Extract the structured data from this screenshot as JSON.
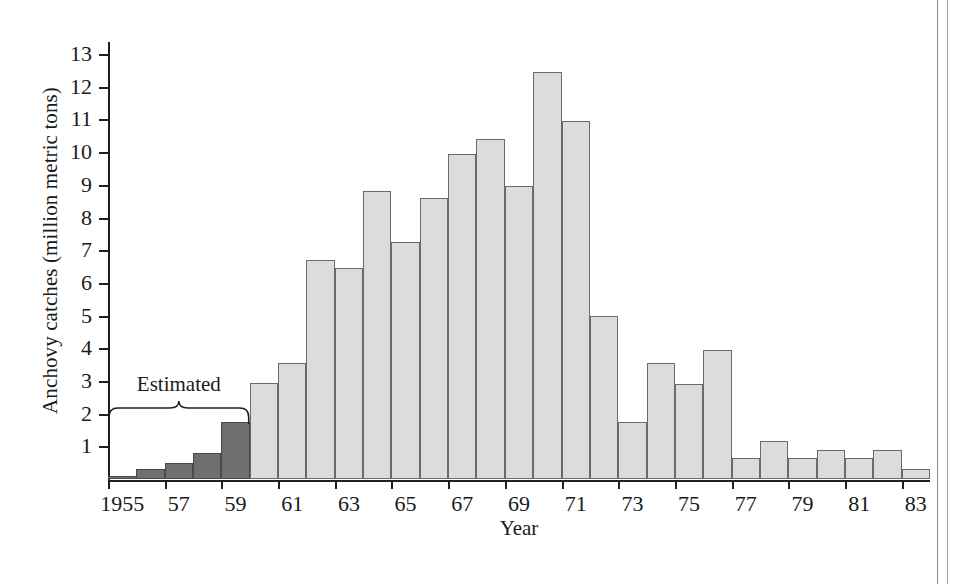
{
  "figure": {
    "y_axis_title": "Anchovy catches (million metric tons)",
    "x_axis_title": "Year",
    "annotation_label": "Estimated",
    "colors": {
      "estimated_bar": "#6f6f6f",
      "reported_bar": "#dcdcdc",
      "axis": "#1f1f1f",
      "bar_outline": "#6a6a6a"
    }
  },
  "chart_data": {
    "type": "bar",
    "title": "",
    "xlabel": "Year",
    "ylabel": "Anchovy catches (million metric tons)",
    "ylim": [
      0,
      13.4
    ],
    "xlim": [
      1954.5,
      1983.5
    ],
    "grid": false,
    "legend": null,
    "ytick_labels": [
      "1",
      "2",
      "3",
      "4",
      "5",
      "6",
      "7",
      "8",
      "9",
      "10",
      "11",
      "12",
      "13"
    ],
    "ytick_values": [
      1,
      2,
      3,
      4,
      5,
      6,
      7,
      8,
      9,
      10,
      11,
      12,
      13
    ],
    "xtick_labels": [
      "1955",
      "57",
      "59",
      "61",
      "63",
      "65",
      "67",
      "69",
      "71",
      "73",
      "75",
      "77",
      "79",
      "81",
      "83"
    ],
    "xtick_values": [
      1955,
      1957,
      1959,
      1961,
      1963,
      1965,
      1967,
      1969,
      1971,
      1973,
      1975,
      1977,
      1979,
      1981,
      1983
    ],
    "categories": [
      1955,
      1956,
      1957,
      1958,
      1959,
      1960,
      1961,
      1962,
      1963,
      1964,
      1965,
      1966,
      1967,
      1968,
      1969,
      1970,
      1971,
      1972,
      1973,
      1974,
      1975,
      1976,
      1977,
      1978,
      1979,
      1980,
      1981,
      1982,
      1983
    ],
    "values": [
      0.1,
      0.3,
      0.5,
      0.8,
      1.75,
      2.95,
      3.55,
      6.7,
      6.45,
      8.8,
      7.25,
      8.6,
      9.95,
      10.4,
      8.95,
      12.45,
      10.95,
      5.0,
      1.75,
      3.55,
      2.9,
      3.95,
      0.65,
      1.15,
      0.65,
      0.9,
      0.65,
      0.9,
      0.3
    ],
    "series_names": [
      "Estimated",
      "Reported"
    ],
    "estimated_years": [
      1955,
      1956,
      1957,
      1958,
      1959
    ],
    "annotations": [
      {
        "text": "Estimated",
        "spans_years": [
          1955,
          1959
        ],
        "type": "brace"
      }
    ]
  }
}
